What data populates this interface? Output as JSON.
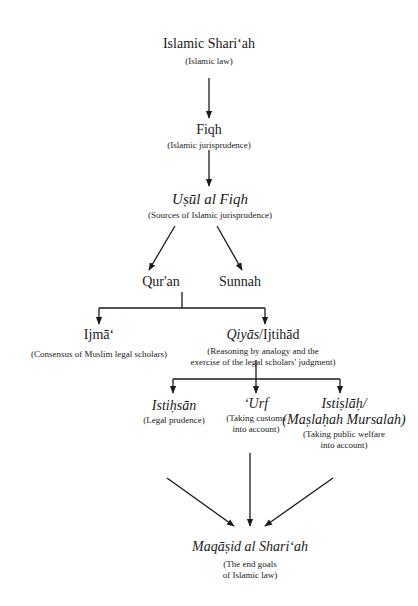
{
  "nodes": {
    "shariah": {
      "title": "Islamic Shari‘ah",
      "subtitle": "(Islamic law)"
    },
    "fiqh": {
      "title": "Fiqh",
      "subtitle": "(Islamic jurisprudence)"
    },
    "usul": {
      "title": "Uṣūl al Fiqh",
      "subtitle": "(Sources of Islamic jurisprudence)"
    },
    "quran": {
      "title": "Qur'an"
    },
    "sunnah": {
      "title": "Sunnah"
    },
    "ijma": {
      "title": "Ijmā‘",
      "subtitle": "(Consensus of Muslim legal scholars)"
    },
    "qiyas": {
      "title_italic": "Qiyās",
      "title_roman": "/Ijtihād",
      "subtitle_line1": "(Reasoning by analogy and the",
      "subtitle_line2": "exercise of the legal scholars' judgment)"
    },
    "istihsan": {
      "title": "Istiḥsān",
      "subtitle": "(Legal prudence)"
    },
    "urf": {
      "title": "‘Urf",
      "subtitle_line1": "(Taking customs",
      "subtitle_line2": "into account)"
    },
    "istislah": {
      "title_line1": "Istiṣlāḥ/",
      "title_line2": "(Maṣlaḥah Mursalah)",
      "subtitle_line1": "(Taking public welfare",
      "subtitle_line2": "into account)"
    },
    "maqasid": {
      "title": "Maqāṣid al Shari‘ah",
      "subtitle_line1": "(The end goals",
      "subtitle_line2": "of Islamic law)"
    }
  },
  "colors": {
    "line": "#1a1a1a",
    "background": "#ffffff"
  }
}
